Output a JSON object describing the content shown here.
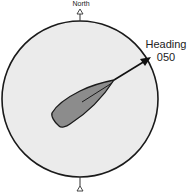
{
  "diagram": {
    "north_label": "North",
    "heading_title": "Heading",
    "heading_value": "050",
    "colors": {
      "circle_fill": "#ebebeb",
      "circle_stroke": "#1a1a1a",
      "boat_fill": "#8c8c8c",
      "boat_stroke": "#1a1a1a",
      "arrow": "#111111"
    },
    "icons": {
      "north_marker": "triangle-up-icon",
      "south_marker": "triangle-up-icon",
      "heading_arrow": "arrow-icon"
    }
  }
}
